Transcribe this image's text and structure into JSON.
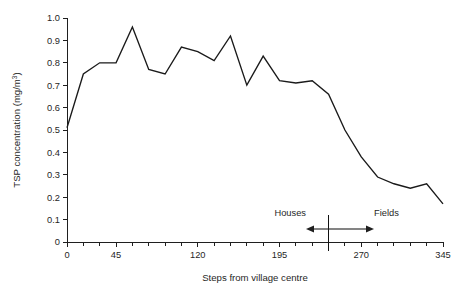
{
  "chart_data": {
    "type": "line",
    "title": "",
    "xlabel": "Steps from village centre",
    "ylabel": "TSP concentration (mg/m³)",
    "ylabel_base": "TSP concentration (mg/m",
    "ylabel_sup": "3",
    "ylabel_tail": ")",
    "xlim": [
      0,
      345
    ],
    "ylim": [
      0,
      1.0
    ],
    "grid": false,
    "legend": null,
    "x_tick_interval": 15,
    "y_tick_interval": 0.1,
    "xticks": [
      0,
      15,
      30,
      45,
      60,
      75,
      90,
      105,
      120,
      135,
      150,
      165,
      180,
      195,
      210,
      225,
      240,
      255,
      270,
      285,
      300,
      315,
      330,
      345
    ],
    "xtick_labels": [
      "0",
      "",
      "",
      "45",
      "",
      "",
      "",
      "",
      "120",
      "",
      "",
      "",
      "",
      "195",
      "",
      "",
      "",
      "",
      "270",
      "",
      "",
      "",
      "",
      "345"
    ],
    "yticks": [
      0,
      0.1,
      0.2,
      0.3,
      0.4,
      0.5,
      0.6,
      0.7,
      0.8,
      0.9,
      1.0
    ],
    "ytick_labels": [
      "0",
      "0.1",
      "0.2",
      "0.3",
      "0.4",
      "0.5",
      "0.6",
      "0.7",
      "0.8",
      "0.9",
      "1.0"
    ],
    "x": [
      0,
      15,
      30,
      45,
      60,
      75,
      90,
      105,
      120,
      135,
      150,
      165,
      180,
      195,
      210,
      225,
      240,
      255,
      270,
      285,
      300,
      315,
      330,
      345
    ],
    "values": [
      0.51,
      0.75,
      0.8,
      0.8,
      0.96,
      0.77,
      0.75,
      0.87,
      0.85,
      0.81,
      0.92,
      0.7,
      0.83,
      0.72,
      0.71,
      0.72,
      0.66,
      0.5,
      0.38,
      0.29,
      0.26,
      0.24,
      0.26,
      0.17
    ],
    "series": [
      {
        "name": "TSP concentration",
        "values": [
          0.51,
          0.75,
          0.8,
          0.8,
          0.96,
          0.77,
          0.75,
          0.87,
          0.85,
          0.81,
          0.92,
          0.7,
          0.83,
          0.72,
          0.71,
          0.72,
          0.66,
          0.5,
          0.38,
          0.29,
          0.26,
          0.24,
          0.26,
          0.17
        ],
        "color": "#1a1a1a"
      }
    ],
    "annotations": {
      "divider_x": 240,
      "left_label": "Houses",
      "right_label": "Fields"
    }
  },
  "colors": {
    "line": "#1a1a1a",
    "axis": "#1f1f1f",
    "background": "#ffffff"
  }
}
